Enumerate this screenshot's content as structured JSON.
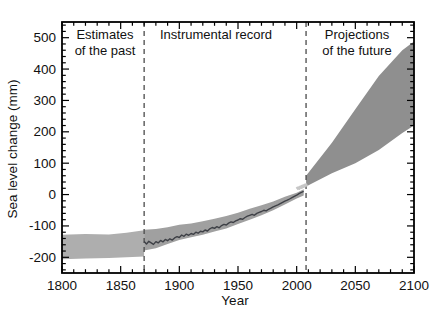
{
  "figure": {
    "region_labels": {
      "past": "Estimates\nof the past",
      "instrumental": "Instrumental record",
      "future": "Projections\nof the future"
    }
  },
  "axes": {
    "xlabel": "Year",
    "ylabel": "Sea level change (mm)"
  },
  "colors": {
    "background": "#ffffff",
    "axis": "#000000",
    "text": "#111111",
    "dashed_line": "#4a4a4a",
    "past_band": "#aeaeae",
    "uncertainty_band": "#a0a0a0",
    "instrumental_line": "#3e4046",
    "satellite_segment": "#c6c6c6",
    "projection_band": "#8f8f8f"
  },
  "chart_data": {
    "type": "composite",
    "title": "",
    "xlabel": "Year",
    "ylabel": "Sea level change (mm)",
    "xlim": [
      1800,
      2100
    ],
    "ylim": [
      -250,
      550
    ],
    "x_major_ticks": [
      1800,
      1850,
      1900,
      1950,
      2000,
      2050,
      2100
    ],
    "x_minor_step": 10,
    "y_major_ticks": [
      -200,
      -100,
      0,
      100,
      200,
      300,
      400,
      500
    ],
    "y_minor_step": 20,
    "grid": false,
    "legend": "none",
    "dashed_separators_x": [
      1870,
      2008
    ],
    "series": [
      {
        "name": "estimates-of-the-past-band",
        "type": "area",
        "top": [
          [
            1800,
            -128
          ],
          [
            1820,
            -126
          ],
          [
            1840,
            -127
          ],
          [
            1855,
            -122
          ],
          [
            1870,
            -114
          ]
        ],
        "bottom": [
          [
            1800,
            -206
          ],
          [
            1820,
            -204
          ],
          [
            1840,
            -202
          ],
          [
            1855,
            -200
          ],
          [
            1870,
            -197
          ]
        ]
      },
      {
        "name": "instrumental-uncertainty-band",
        "type": "area",
        "x": [
          1870,
          1880,
          1890,
          1900,
          1910,
          1920,
          1930,
          1940,
          1950,
          1960,
          1970,
          1980,
          1990,
          2000,
          2006
        ],
        "hi": [
          -112,
          -110,
          -104,
          -96,
          -92,
          -85,
          -77,
          -68,
          -58,
          -45,
          -34,
          -22,
          -7,
          6,
          17
        ],
        "lo": [
          -178,
          -171,
          -158,
          -145,
          -136,
          -128,
          -118,
          -108,
          -94,
          -80,
          -66,
          -50,
          -32,
          -13,
          -3
        ]
      },
      {
        "name": "instrumental-record-line",
        "type": "line",
        "points": [
          [
            1870,
            -150
          ],
          [
            1872,
            -158
          ],
          [
            1874,
            -149
          ],
          [
            1876,
            -154
          ],
          [
            1878,
            -159
          ],
          [
            1880,
            -150
          ],
          [
            1882,
            -154
          ],
          [
            1884,
            -146
          ],
          [
            1886,
            -151
          ],
          [
            1888,
            -143
          ],
          [
            1890,
            -147
          ],
          [
            1892,
            -141
          ],
          [
            1894,
            -145
          ],
          [
            1896,
            -138
          ],
          [
            1898,
            -134
          ],
          [
            1900,
            -137
          ],
          [
            1902,
            -129
          ],
          [
            1904,
            -133
          ],
          [
            1906,
            -126
          ],
          [
            1908,
            -130
          ],
          [
            1910,
            -124
          ],
          [
            1912,
            -127
          ],
          [
            1914,
            -120
          ],
          [
            1916,
            -123
          ],
          [
            1918,
            -117
          ],
          [
            1920,
            -119
          ],
          [
            1922,
            -113
          ],
          [
            1924,
            -116
          ],
          [
            1926,
            -109
          ],
          [
            1928,
            -105
          ],
          [
            1930,
            -108
          ],
          [
            1932,
            -102
          ],
          [
            1934,
            -106
          ],
          [
            1936,
            -99
          ],
          [
            1938,
            -95
          ],
          [
            1940,
            -97
          ],
          [
            1942,
            -91
          ],
          [
            1944,
            -87
          ],
          [
            1946,
            -89
          ],
          [
            1948,
            -84
          ],
          [
            1950,
            -81
          ],
          [
            1952,
            -77
          ],
          [
            1954,
            -79
          ],
          [
            1956,
            -73
          ],
          [
            1958,
            -69
          ],
          [
            1960,
            -66
          ],
          [
            1962,
            -63
          ],
          [
            1964,
            -66
          ],
          [
            1966,
            -60
          ],
          [
            1968,
            -57
          ],
          [
            1970,
            -54
          ],
          [
            1972,
            -50
          ],
          [
            1974,
            -52
          ],
          [
            1976,
            -47
          ],
          [
            1978,
            -43
          ],
          [
            1980,
            -39
          ],
          [
            1982,
            -36
          ],
          [
            1984,
            -33
          ],
          [
            1986,
            -29
          ],
          [
            1988,
            -25
          ],
          [
            1990,
            -21
          ],
          [
            1992,
            -18
          ],
          [
            1994,
            -14
          ],
          [
            1996,
            -10
          ],
          [
            1998,
            -6
          ],
          [
            2000,
            -2
          ],
          [
            2002,
            3
          ],
          [
            2004,
            7
          ],
          [
            2006,
            10
          ]
        ]
      },
      {
        "name": "satellite-segment",
        "type": "line",
        "points": [
          [
            2000,
            18
          ],
          [
            2001,
            21
          ],
          [
            2002,
            20
          ],
          [
            2003,
            24
          ],
          [
            2004,
            23
          ],
          [
            2005,
            27
          ],
          [
            2006,
            26
          ],
          [
            2007,
            30
          ],
          [
            2008,
            30
          ],
          [
            2009,
            33
          ]
        ]
      },
      {
        "name": "projections-of-the-future-band",
        "type": "area",
        "top": [
          [
            2008,
            60
          ],
          [
            2030,
            165
          ],
          [
            2050,
            272
          ],
          [
            2070,
            378
          ],
          [
            2090,
            460
          ],
          [
            2100,
            488
          ]
        ],
        "bottom": [
          [
            2008,
            26
          ],
          [
            2030,
            68
          ],
          [
            2050,
            100
          ],
          [
            2070,
            142
          ],
          [
            2090,
            196
          ],
          [
            2100,
            220
          ]
        ]
      }
    ]
  }
}
